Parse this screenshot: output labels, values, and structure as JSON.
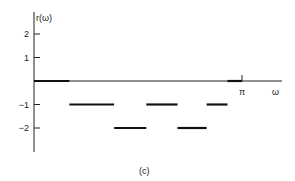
{
  "chart_data": {
    "type": "line",
    "style": "piecewise-constant (step segments)",
    "title": "",
    "caption": "(c)",
    "ylabel": "r(ω)",
    "xlabel": "ω",
    "x_tick_labels": [
      "π"
    ],
    "y_ticks": [
      2,
      1,
      -1,
      -2
    ],
    "y_tick_labels": [
      "2",
      "1",
      "−1",
      "−2"
    ],
    "xlim": [
      0,
      1.25
    ],
    "x_unit": "π",
    "ylim": [
      -2.9,
      2.6
    ],
    "grid": false,
    "segments": [
      {
        "x0": 0.0,
        "x1": 0.17,
        "y": 0
      },
      {
        "x0": 0.17,
        "x1": 0.385,
        "y": -1
      },
      {
        "x0": 0.385,
        "x1": 0.54,
        "y": -2
      },
      {
        "x0": 0.54,
        "x1": 0.69,
        "y": -1
      },
      {
        "x0": 0.69,
        "x1": 0.83,
        "y": -2
      },
      {
        "x0": 0.83,
        "x1": 0.93,
        "y": -1
      },
      {
        "x0": 0.93,
        "x1": 1.0,
        "y": 0
      }
    ]
  }
}
